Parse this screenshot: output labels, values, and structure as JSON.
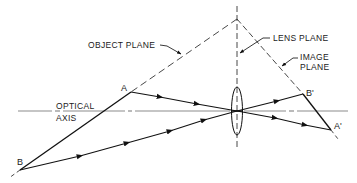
{
  "diagram": {
    "type": "optics-ray-diagram",
    "labels": {
      "object_plane": "OBJECT PLANE",
      "lens_plane": "LENS PLANE",
      "image_plane_line1": "IMAGE",
      "image_plane_line2": "PLANE",
      "optical_axis_line1": "OPTICAL",
      "optical_axis_line2": "AXIS"
    },
    "points": {
      "A": "A",
      "B": "B",
      "A_image": "A'",
      "B_image": "B'"
    },
    "rays": [
      {
        "from": "A",
        "through": "lens-center",
        "to": "A'"
      },
      {
        "from": "B",
        "through": "lens-center",
        "to": "B'"
      }
    ],
    "colors": {
      "line": "#111111",
      "axis": "#8c8c8c",
      "background": "#ffffff"
    }
  }
}
